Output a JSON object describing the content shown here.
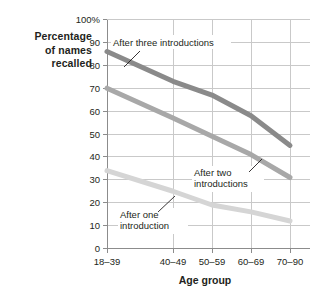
{
  "chart_data": {
    "type": "line",
    "title": "",
    "xlabel": "Age group",
    "ylabel": "Percentage of names recalled",
    "categories": [
      "18–39",
      "40–49",
      "50–59",
      "60–69",
      "70–90"
    ],
    "ytick_labels": [
      "100%",
      "90",
      "80",
      "70",
      "60",
      "50",
      "40",
      "30",
      "20",
      "10",
      "0"
    ],
    "ytick_values": [
      100,
      90,
      80,
      70,
      60,
      50,
      40,
      30,
      20,
      10,
      0
    ],
    "ylim": [
      0,
      100
    ],
    "grid": true,
    "legend": "annotations-inline",
    "series": [
      {
        "name": "After three introductions",
        "color": "#8a8a8a",
        "values": [
          86,
          73,
          67,
          58,
          45
        ]
      },
      {
        "name": "After two introductions",
        "color": "#a8a8a8",
        "values": [
          70,
          57,
          49,
          41,
          31
        ]
      },
      {
        "name": "After one introduction",
        "color": "#d5d5d5",
        "values": [
          34,
          25,
          19,
          16,
          12
        ]
      }
    ],
    "annotations": [
      {
        "text": "After three introductions",
        "series": "After three introductions"
      },
      {
        "text_line1": "After two",
        "text_line2": "introductions",
        "series": "After two introductions"
      },
      {
        "text_line1": "After one",
        "text_line2": "introduction",
        "series": "After one introduction"
      }
    ]
  },
  "ylabel_lines": [
    "Percentage",
    "of names",
    "recalled"
  ],
  "axis": {
    "x_title": "Age group",
    "y_ticks": [
      "100%",
      "90",
      "80",
      "70",
      "60",
      "50",
      "40",
      "30",
      "20",
      "10",
      "0"
    ],
    "x_ticks": [
      "18–39",
      "40–49",
      "50–59",
      "60–69",
      "70–90"
    ]
  },
  "annotations": {
    "three": "After three introductions",
    "two_l1": "After two",
    "two_l2": "introductions",
    "one_l1": "After one",
    "one_l2": "introduction"
  },
  "colors": {
    "grid": "#c9c9c9",
    "axis": "#8c8c8c",
    "series_three": "#8a8a8a",
    "series_two": "#a8a8a8",
    "series_one": "#d5d5d5",
    "text": "#231f20",
    "background": "#ffffff"
  }
}
